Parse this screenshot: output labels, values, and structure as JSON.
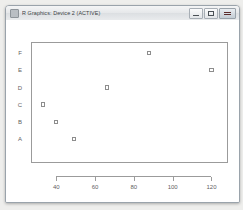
{
  "window": {
    "title": "R Graphics: Device 2 (ACTIVE)",
    "icon": "r-graphics-icon",
    "controls": {
      "minimize_label": "Minimize",
      "maximize_label": "Maximize",
      "close_label": "Close"
    }
  },
  "chart_data": {
    "type": "scatter",
    "title": "",
    "xlabel": "",
    "ylabel": "",
    "grid": false,
    "legend": null,
    "xlim": [
      27,
      128
    ],
    "xticks": [
      40,
      60,
      80,
      100,
      120
    ],
    "xtick_labels": [
      "40",
      "60",
      "80",
      "100",
      "120"
    ],
    "ycategories": [
      "A",
      "B",
      "C",
      "D",
      "E",
      "F"
    ],
    "ytick_labels": [
      "A",
      "B",
      "C",
      "D",
      "E",
      "F"
    ],
    "point_symbol": "open-square",
    "point_color": "#8d8d8d",
    "points": [
      {
        "x": 49,
        "y": "A"
      },
      {
        "x": 40,
        "y": "B"
      },
      {
        "x": 33,
        "y": "C"
      },
      {
        "x": 66,
        "y": "D"
      },
      {
        "x": 120,
        "y": "E"
      },
      {
        "x": 88,
        "y": "F"
      }
    ],
    "x": [
      49,
      40,
      33,
      66,
      120,
      88
    ],
    "y": [
      "A",
      "B",
      "C",
      "D",
      "E",
      "F"
    ]
  }
}
